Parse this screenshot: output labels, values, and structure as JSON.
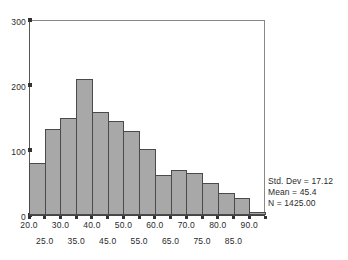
{
  "chart_data": {
    "type": "bar",
    "title": "",
    "subtitle": "",
    "xlabel": "",
    "ylabel": "",
    "grid": false,
    "legend_position": "none",
    "ylim": [
      0,
      300
    ],
    "xlim": [
      20.0,
      95.0
    ],
    "bin_width": 5.0,
    "y_ticks": [
      {
        "value": 300,
        "label": "300"
      },
      {
        "value": 200,
        "label": "200"
      },
      {
        "value": 100,
        "label": "100"
      },
      {
        "value": 0,
        "label": "0"
      }
    ],
    "x_tick_labels_upper": [
      "20.0",
      "30.0",
      "40.0",
      "50.0",
      "60.0",
      "70.0",
      "80.0",
      "90.0"
    ],
    "x_tick_labels_lower": [
      "25.0",
      "35.0",
      "45.0",
      "55.0",
      "65.0",
      "75.0",
      "85.0"
    ],
    "x_tick_values_upper": [
      20.0,
      30.0,
      40.0,
      50.0,
      60.0,
      70.0,
      80.0,
      90.0
    ],
    "x_tick_values_lower": [
      25.0,
      35.0,
      45.0,
      55.0,
      65.0,
      75.0,
      85.0
    ],
    "bin_starts": [
      20.0,
      25.0,
      30.0,
      35.0,
      40.0,
      45.0,
      50.0,
      55.0,
      60.0,
      65.0,
      70.0,
      75.0,
      80.0,
      85.0,
      90.0
    ],
    "categories": [
      "20-25",
      "25-30",
      "30-35",
      "35-40",
      "40-45",
      "45-50",
      "50-55",
      "55-60",
      "60-65",
      "65-70",
      "70-75",
      "75-80",
      "80-85",
      "85-90",
      "90-95"
    ],
    "values": [
      80,
      132,
      150,
      210,
      158,
      144,
      129,
      101,
      62,
      70,
      65,
      50,
      34,
      26,
      5
    ],
    "bar_fill_color": "#a8a8a8",
    "bar_edge_color": "#4a4a4a",
    "annotations": [
      "Std. Dev = 17.12",
      "Mean = 45.4",
      "N = 1425.00"
    ]
  },
  "stats": {
    "std_dev": "Std. Dev = 17.12",
    "mean": "Mean = 45.4",
    "n": "N = 1425.00"
  }
}
